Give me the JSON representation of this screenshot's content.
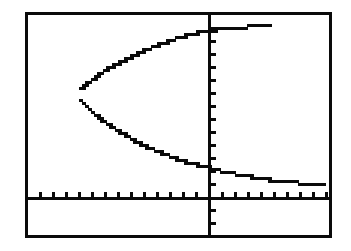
{
  "screen": {
    "device": "graphing-calculator",
    "frame_color": "#0a0a0a",
    "background_color": "#ffffff",
    "plot_color": "#0a0a0a",
    "frame": {
      "x": 25,
      "y": 12,
      "width": 307,
      "height": 226,
      "border_width": 3
    }
  },
  "chart_data": {
    "type": "line",
    "title": "",
    "subtitle": "",
    "xlabel": "",
    "ylabel": "",
    "grid": false,
    "legend": "none",
    "axes": {
      "x_axis_pixel_y": 197,
      "y_axis_pixel_x": 208,
      "x_tick_spacing_px": 13,
      "y_tick_spacing_px": 13,
      "x_tick_count": 23,
      "y_tick_count": 16,
      "tick_length_px": 6,
      "xlim": [
        -14,
        9.5
      ],
      "ylim": [
        -3,
        13.8
      ]
    },
    "series": [
      {
        "name": "upper-branch",
        "points_px": [
          [
            79,
            88
          ],
          [
            83,
            84
          ],
          [
            87,
            81
          ],
          [
            91,
            78
          ],
          [
            95,
            75
          ],
          [
            99,
            72
          ],
          [
            104,
            69
          ],
          [
            109,
            66
          ],
          [
            114,
            63
          ],
          [
            120,
            60
          ],
          [
            126,
            57
          ],
          [
            132,
            54
          ],
          [
            139,
            51
          ],
          [
            146,
            48
          ],
          [
            153,
            45
          ],
          [
            161,
            42
          ],
          [
            169,
            39
          ],
          [
            178,
            36
          ],
          [
            188,
            33
          ],
          [
            199,
            31
          ],
          [
            211,
            29
          ],
          [
            224,
            27
          ],
          [
            238,
            26
          ],
          [
            252,
            25
          ],
          [
            268,
            24
          ]
        ]
      },
      {
        "name": "lower-branch",
        "points_px": [
          [
            79,
            99
          ],
          [
            83,
            103
          ],
          [
            87,
            107
          ],
          [
            91,
            111
          ],
          [
            95,
            114
          ],
          [
            100,
            118
          ],
          [
            105,
            122
          ],
          [
            111,
            126
          ],
          [
            117,
            130
          ],
          [
            124,
            134
          ],
          [
            131,
            138
          ],
          [
            139,
            142
          ],
          [
            147,
            146
          ],
          [
            156,
            150
          ],
          [
            166,
            154
          ],
          [
            177,
            158
          ],
          [
            189,
            162
          ],
          [
            202,
            165
          ],
          [
            216,
            169
          ],
          [
            231,
            172
          ],
          [
            247,
            175
          ],
          [
            264,
            178
          ],
          [
            282,
            180
          ],
          [
            301,
            182
          ],
          [
            322,
            183
          ]
        ]
      }
    ],
    "vertex_px": [
      78,
      93
    ],
    "y_intercepts_px": [
      [
        208,
        31
      ],
      [
        208,
        165
      ]
    ]
  }
}
